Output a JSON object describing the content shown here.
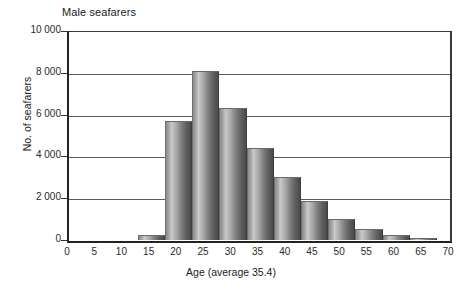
{
  "chart_data": {
    "type": "bar",
    "title": "Male seafarers",
    "xlabel": "Age (average 35.4)",
    "ylabel": "No. of seafarers",
    "grid": true,
    "legend": false,
    "xlim": [
      0,
      70
    ],
    "ylim": [
      0,
      10000
    ],
    "bin_width": 5,
    "x_ticks": [
      "0",
      "5",
      "10",
      "15",
      "20",
      "25",
      "30",
      "35",
      "40",
      "45",
      "50",
      "55",
      "60",
      "65",
      "70"
    ],
    "x_tick_values": [
      0,
      5,
      10,
      15,
      20,
      25,
      30,
      35,
      40,
      45,
      50,
      55,
      60,
      65,
      70
    ],
    "y_ticks": [
      "0",
      "2 000",
      "4 000",
      "6 000",
      "8 000",
      "10 000"
    ],
    "y_tick_values": [
      0,
      2000,
      4000,
      6000,
      8000,
      10000
    ],
    "categories": [
      "13-18",
      "18-23",
      "23-28",
      "28-33",
      "33-38",
      "38-43",
      "43-48",
      "48-53",
      "53-58",
      "58-63",
      "63-68"
    ],
    "bin_starts": [
      13,
      18,
      23,
      28,
      33,
      38,
      43,
      48,
      53,
      58,
      63
    ],
    "values": [
      250,
      5700,
      8100,
      6300,
      4400,
      3000,
      1880,
      1000,
      550,
      250,
      100
    ],
    "colors": {
      "bar_light": "#c9c9c9",
      "bar_mid": "#8d8d8d",
      "bar_dark": "#4a4a4a",
      "axis": "#222222",
      "gridline": "#5a5a5a",
      "background": "#ffffff",
      "text": "#1b1b1b"
    }
  }
}
